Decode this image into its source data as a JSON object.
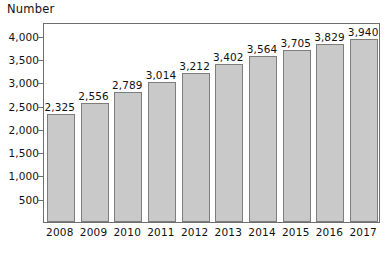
{
  "chart_data": {
    "type": "bar",
    "title": "Number",
    "xlabel": "",
    "ylabel": "",
    "categories": [
      "2008",
      "2009",
      "2010",
      "2011",
      "2012",
      "2013",
      "2014",
      "2015",
      "2016",
      "2017"
    ],
    "values": [
      2325,
      2556,
      2789,
      3014,
      3212,
      3402,
      3564,
      3705,
      3829,
      3940
    ],
    "value_labels": [
      "2,325",
      "2,556",
      "2,789",
      "3,014",
      "3,212",
      "3,402",
      "3,564",
      "3,705",
      "3,829",
      "3,940"
    ],
    "ylim": [
      0,
      4300
    ],
    "y_ticks": [
      500,
      1000,
      1500,
      2000,
      2500,
      3000,
      3500,
      4000
    ],
    "y_tick_labels": [
      "500",
      "1,000",
      "1,500",
      "2,000",
      "2,500",
      "3,000",
      "3,500",
      "4,000"
    ],
    "grid": false,
    "legend": null,
    "colors": {
      "bar_fill": "#c9c9c9",
      "bar_border": "#7d7d7d",
      "axis": "#6f6f6f",
      "text": "#111111",
      "background": "#ffffff"
    }
  }
}
